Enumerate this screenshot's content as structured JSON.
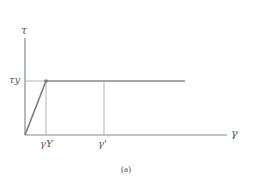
{
  "diagram": {
    "caption": "(a)",
    "axes": {
      "y_label": "τ",
      "x_label": "γ"
    },
    "ticks": {
      "tau_y": "τy",
      "gamma_Y": "γY",
      "gamma_prime": "γ'"
    },
    "colors": {
      "line": "#8a8a8a",
      "guide": "#b5b5b5",
      "text": "#555555"
    }
  }
}
